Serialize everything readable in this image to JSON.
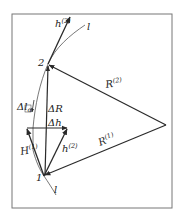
{
  "figure": {
    "colors": {
      "line": "#2a2a2a",
      "frame": "#777777",
      "background": "#ffffff"
    }
  },
  "labels": {
    "point_1": "1",
    "point_2": "2",
    "curve_top": "l",
    "curve_bottom": "l",
    "h2_top": {
      "base": "h",
      "sup": "(2)"
    },
    "R2": {
      "base": "R",
      "sup": "(2)"
    },
    "R1": {
      "base": "R",
      "sup": "(1)"
    },
    "delta_R": "ΔR",
    "delta_h": "Δh",
    "delta_l": {
      "base": "Δl",
      "sub": "α"
    },
    "H1": {
      "base": "H",
      "sup": "(1)"
    },
    "h2_bottom": {
      "base": "h",
      "sup": "(2)"
    }
  }
}
